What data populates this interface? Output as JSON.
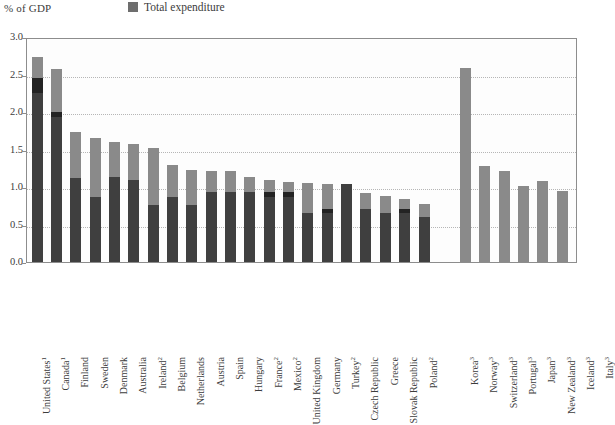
{
  "header": {
    "y_unit_label": "% of GDP",
    "legend_label": "Total expenditure",
    "legend_color": "#8a8a8a"
  },
  "colors": {
    "total_light": "#8a8a8a",
    "base_dark": "#3f3f3f",
    "mid_darkest": "#232323",
    "frame": "#8d8d8d",
    "grid": "#b6b6b6",
    "text": "#3c3c3c"
  },
  "chart_data": {
    "type": "bar",
    "stacked": true,
    "title": "",
    "subtitle": "",
    "xlabel": "",
    "ylabel": "% of GDP",
    "ylim": [
      0.0,
      3.0
    ],
    "yticks": [
      "0.0",
      "0.5",
      "1.0",
      "1.5",
      "2.0",
      "2.5",
      "3.0"
    ],
    "ytick_values": [
      0.0,
      0.5,
      1.0,
      1.5,
      2.0,
      2.5,
      3.0
    ],
    "grid": true,
    "legend": [
      "Total expenditure"
    ],
    "legend_position": "top-center",
    "series": [
      {
        "name": "Base (dark)",
        "color": "#3f3f3f"
      },
      {
        "name": "Middle (darkest)",
        "color": "#232323"
      },
      {
        "name": "Total expenditure (light)",
        "color": "#8a8a8a"
      }
    ],
    "groups": [
      {
        "name": "group-1",
        "categories": [
          "United States",
          "Canada",
          "Finland",
          "Sweden",
          "Denmark",
          "Australia",
          "Ireland",
          "Belgium",
          "Netherlands",
          "Austria",
          "Spain",
          "Hungary",
          "France",
          "Mexico",
          "United Kingdom",
          "Germany",
          "Turkey",
          "Czech Republic",
          "Greece",
          "Slovak Republic",
          "Poland"
        ],
        "footnotes": [
          "1",
          "1",
          "",
          "",
          "",
          "",
          "2",
          "",
          "",
          "",
          "",
          "",
          "2",
          "2",
          "",
          "",
          "2",
          "",
          "",
          "",
          "2"
        ],
        "base": [
          2.25,
          1.93,
          1.12,
          0.87,
          1.13,
          1.1,
          0.76,
          0.87,
          0.76,
          0.93,
          0.93,
          0.93,
          0.87,
          0.87,
          0.65,
          0.65,
          1.04,
          0.71,
          0.65,
          0.65,
          0.6
        ],
        "mid": [
          2.45,
          2.0,
          1.12,
          0.87,
          1.13,
          1.1,
          0.76,
          0.87,
          0.76,
          0.93,
          0.93,
          0.93,
          0.93,
          0.93,
          0.65,
          0.71,
          1.04,
          0.71,
          0.65,
          0.71,
          0.6
        ],
        "total": [
          2.73,
          2.58,
          1.73,
          1.66,
          1.6,
          1.57,
          1.52,
          1.3,
          1.23,
          1.22,
          1.21,
          1.13,
          1.1,
          1.07,
          1.05,
          1.04,
          1.04,
          0.92,
          0.88,
          0.84,
          0.77
        ]
      },
      {
        "name": "group-2",
        "categories": [
          "Korea",
          "Norway",
          "Switzerland",
          "Portugal",
          "Japan",
          "New Zealand",
          "Iceland",
          "Italy"
        ],
        "footnotes": [
          "3",
          "3",
          "3",
          "3",
          "3",
          "3",
          "3",
          "3"
        ],
        "base": [
          0,
          0,
          0,
          0,
          0,
          0,
          0,
          0
        ],
        "mid": [
          0,
          0,
          0,
          0,
          0,
          0,
          0,
          0
        ],
        "total": [
          2.59,
          1.28,
          1.21,
          1.02,
          1.08,
          0.95,
          0.92,
          0.9
        ]
      }
    ]
  }
}
